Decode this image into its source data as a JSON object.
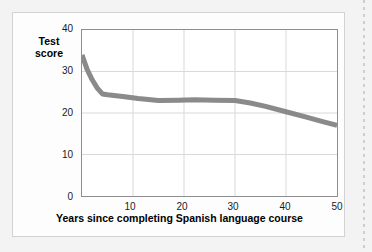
{
  "figure": {
    "background_color": "#f3f3f3",
    "panel_color": "#fdfdfd",
    "panel_border_color": "#d2d2d2",
    "plot_border_color": "#8e8e8e",
    "gridline_color": "#d9d9d9",
    "line_color": "#8a8a8a"
  },
  "y_axis_title": {
    "line1": "Test",
    "line2": "score"
  },
  "x_axis_title": "Years since completing Spanish language course",
  "chart_data": {
    "type": "line",
    "title": "",
    "subtitle": "",
    "xlabel": "Years since completing Spanish language course",
    "ylabel": "Test score",
    "xlim": [
      0,
      50
    ],
    "ylim": [
      0,
      40
    ],
    "xticks": [
      0,
      10,
      20,
      30,
      40,
      50
    ],
    "xtick_labels": [
      "",
      "10",
      "20",
      "30",
      "40",
      "50"
    ],
    "yticks": [
      0,
      10,
      20,
      30,
      40
    ],
    "ytick_labels": [
      "0",
      "10",
      "20",
      "30",
      "40"
    ],
    "grid": true,
    "grid_axis": "both",
    "legend": false,
    "legend_position": "none",
    "line_color": "#8a8a8a",
    "line_width": 5,
    "series": [
      {
        "name": "Mean test score",
        "x": [
          0,
          1,
          2,
          3,
          4,
          5,
          8,
          11,
          15,
          19,
          22,
          26,
          30,
          33,
          36,
          40,
          44,
          47,
          50
        ],
        "values": [
          34.0,
          30.5,
          28.0,
          26.0,
          24.6,
          24.4,
          24.0,
          23.5,
          23.0,
          23.1,
          23.2,
          23.1,
          23.0,
          22.4,
          21.6,
          20.3,
          19.0,
          18.0,
          17.0
        ]
      }
    ]
  }
}
